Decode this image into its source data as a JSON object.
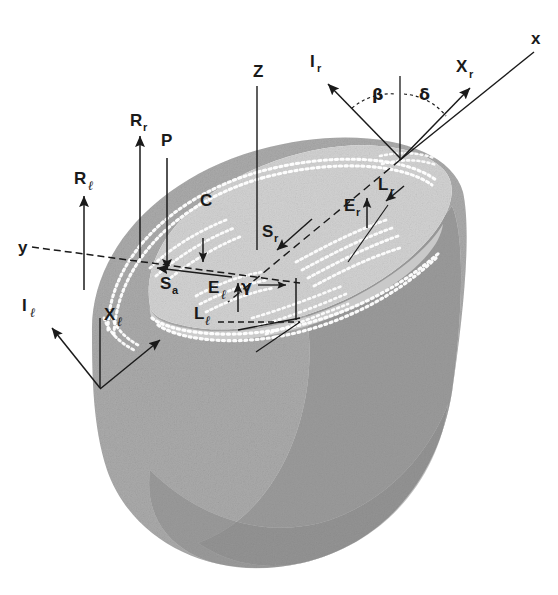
{
  "figure": {
    "background_color": "#ffffff",
    "line_color": "#1a1a1a",
    "body_fill": "#cfcfcf",
    "top_surface_fill": "#e7e7e7",
    "shadow_fill": "#c0c0c0",
    "speckle_color": "#ffffff"
  },
  "axes": [
    {
      "id": "z-axis",
      "label": "Z",
      "label_x": 253,
      "label_y": 77,
      "type": "plain-line"
    },
    {
      "id": "y-axis",
      "label": "y",
      "label_x": 18,
      "label_y": 253,
      "type": "dashed-line"
    },
    {
      "id": "x-axis",
      "label": "x",
      "label_x": 531,
      "label_y": 44,
      "type": "plain-line"
    }
  ],
  "vectors": [
    {
      "id": "R-r",
      "base": "R",
      "sub": "r",
      "label_x": 130,
      "label_y": 126,
      "direction": "up"
    },
    {
      "id": "P",
      "base": "P",
      "sub": "",
      "label_x": 166,
      "label_y": 146,
      "direction": "down"
    },
    {
      "id": "R-l",
      "base": "R",
      "sub": "ℓ",
      "label_x": 77,
      "label_y": 184,
      "direction": "up"
    },
    {
      "id": "S-a",
      "base": "S",
      "sub": "a",
      "label_x": 166,
      "label_y": 289,
      "direction": "left"
    },
    {
      "id": "S-r",
      "base": "S",
      "sub": "r",
      "label_x": 268,
      "label_y": 237,
      "direction": "down-left"
    },
    {
      "id": "E-l",
      "base": "E",
      "sub": "ℓ",
      "label_x": 213,
      "label_y": 293,
      "direction": "up"
    },
    {
      "id": "E-r",
      "base": "E",
      "sub": "r",
      "label_x": 350,
      "label_y": 211,
      "direction": "up"
    },
    {
      "id": "L-l",
      "base": "L",
      "sub": "ℓ",
      "label_x": 198,
      "label_y": 319,
      "direction": "right"
    },
    {
      "id": "L-r",
      "base": "L",
      "sub": "r",
      "label_x": 383,
      "label_y": 190,
      "direction": "down-left"
    },
    {
      "id": "I-r",
      "base": "I",
      "sub": "r",
      "label_x": 313,
      "label_y": 67,
      "direction": "up-left"
    },
    {
      "id": "I-l",
      "base": "I",
      "sub": "ℓ",
      "label_x": 25,
      "label_y": 311,
      "direction": "up-left"
    },
    {
      "id": "X-r",
      "base": "X",
      "sub": "r",
      "label_x": 463,
      "label_y": 72,
      "direction": "up-right"
    },
    {
      "id": "X-l",
      "base": "X",
      "sub": "ℓ",
      "label_x": 110,
      "label_y": 320,
      "direction": "up-right"
    },
    {
      "id": "C",
      "base": "C",
      "sub": "",
      "label_x": 206,
      "label_y": 206,
      "direction": "none"
    }
  ],
  "angles": [
    {
      "id": "beta",
      "symbol": "β",
      "label_x": 376,
      "label_y": 98
    },
    {
      "id": "delta",
      "symbol": "δ",
      "label_x": 423,
      "label_y": 98
    },
    {
      "id": "gamma",
      "symbol": "γ",
      "label_x": 245,
      "label_y": 291
    }
  ]
}
